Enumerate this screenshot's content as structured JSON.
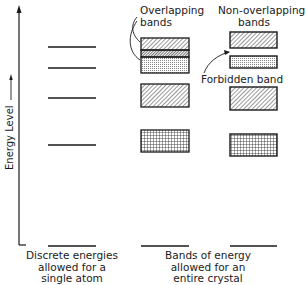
{
  "diagram": {
    "type": "energy-level-diagram",
    "axis": {
      "label": "Energy Level",
      "direction": "up"
    },
    "columns": [
      {
        "id": "single-atom",
        "caption": [
          "Discrete energies",
          "allowed for a",
          "single atom"
        ],
        "levels": [
          1,
          2,
          3,
          4,
          5
        ],
        "level_type": "discrete lines"
      },
      {
        "id": "crystal-overlapping",
        "caption": [
          "Bands of energy",
          "allowed for an",
          "entire crystal"
        ],
        "annotation": [
          "Overlapping",
          "bands"
        ],
        "bands": [
          {
            "name": "upper band",
            "fill": "diagonal hatch"
          },
          {
            "name": "overlap region",
            "fill": "dense hatch"
          },
          {
            "name": "second band",
            "fill": "dotted"
          },
          {
            "name": "third band",
            "fill": "diagonal hatch"
          },
          {
            "name": "fourth band",
            "fill": "crosshatch grid"
          },
          {
            "name": "lowest level",
            "fill": "line"
          }
        ]
      },
      {
        "id": "crystal-non-overlapping",
        "annotation": [
          "Non-overlapping",
          "bands"
        ],
        "gap_label": "Forbidden band",
        "bands": [
          {
            "name": "upper band",
            "fill": "diagonal hatch"
          },
          {
            "name": "second band",
            "fill": "dotted"
          },
          {
            "name": "third band",
            "fill": "diagonal hatch"
          },
          {
            "name": "fourth band",
            "fill": "crosshatch grid"
          },
          {
            "name": "lowest level",
            "fill": "line"
          }
        ]
      }
    ]
  },
  "labels": {
    "axis": "Energy Level",
    "overlapping_1": "Overlapping",
    "overlapping_2": "bands",
    "nonoverlapping_1": "Non-overlapping",
    "nonoverlapping_2": "bands",
    "forbidden": "Forbidden band",
    "caption_left_1": "Discrete energies",
    "caption_left_2": "allowed for a",
    "caption_left_3": "single atom",
    "caption_mid_1": "Bands of energy",
    "caption_mid_2": "allowed for an",
    "caption_mid_3": "entire crystal"
  },
  "colors": {
    "ink": "#1a1a1a",
    "background": "#ffffff"
  }
}
